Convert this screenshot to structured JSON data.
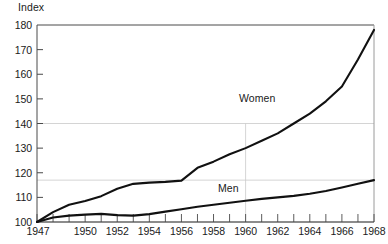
{
  "chart_data": {
    "type": "line",
    "title": "",
    "subtitle": "",
    "ylabel": "Index",
    "xlabel": "",
    "ylim": [
      100,
      180
    ],
    "xlim": [
      1947,
      1968
    ],
    "grid": "partial",
    "legend_position": "inline-annotation",
    "y_ticks": [
      100,
      110,
      120,
      130,
      140,
      150,
      160,
      170,
      180
    ],
    "x_ticks": [
      1947,
      1948,
      1949,
      1950,
      1951,
      1952,
      1953,
      1954,
      1955,
      1956,
      1957,
      1958,
      1959,
      1960,
      1961,
      1962,
      1963,
      1964,
      1965,
      1966,
      1967,
      1968
    ],
    "x_tick_labels": [
      "1947",
      "",
      "",
      "1950",
      "",
      "1952",
      "",
      "1954",
      "",
      "1956",
      "",
      "1958",
      "",
      "1960",
      "",
      "1962",
      "",
      "1964",
      "",
      "1966",
      "",
      "1968"
    ],
    "reference_lines": {
      "horizontal": [
        140,
        117
      ],
      "vertical": [
        1960
      ]
    },
    "x": [
      1947,
      1948,
      1949,
      1950,
      1951,
      1952,
      1953,
      1954,
      1955,
      1956,
      1957,
      1958,
      1959,
      1960,
      1961,
      1962,
      1963,
      1964,
      1965,
      1966,
      1967,
      1968
    ],
    "series": [
      {
        "name": "Women",
        "label": "Women",
        "color": "#111111",
        "values": [
          100.0,
          104.5,
          107.5,
          109.0,
          111.5,
          114.5,
          115.5,
          116.0,
          116.5,
          117.0,
          121.5,
          124.0,
          127.0,
          129.5,
          132.0,
          134.5,
          137.0,
          140.0,
          143.5,
          147.0,
          149.5,
          153.0
        ]
      },
      {
        "name": "Men",
        "label": "Men",
        "color": "#111111",
        "values": [
          100.0,
          101.5,
          102.5,
          103.0,
          103.2,
          102.8,
          102.5,
          103.0,
          104.0,
          105.0,
          106.0,
          107.0,
          108.0,
          109.0,
          110.0,
          110.8,
          111.3,
          112.0,
          113.0,
          114.2,
          115.5,
          117.0
        ]
      }
    ],
    "series_actual": {
      "women_points": [
        [
          1947,
          100.0
        ],
        [
          1948,
          104.0
        ],
        [
          1949,
          107.0
        ],
        [
          1950,
          108.5
        ],
        [
          1951,
          110.5
        ],
        [
          1952,
          113.5
        ],
        [
          1953,
          115.5
        ],
        [
          1954,
          116.0
        ],
        [
          1955,
          116.3
        ],
        [
          1956,
          116.8
        ],
        [
          1957,
          122.0
        ],
        [
          1958,
          124.5
        ],
        [
          1959,
          127.5
        ],
        [
          1960,
          130.0
        ],
        [
          1961,
          133.0
        ],
        [
          1962,
          136.0
        ],
        [
          1963,
          140.0
        ],
        [
          1964,
          144.0
        ],
        [
          1965,
          149.0
        ],
        [
          1966,
          155.0
        ],
        [
          1967,
          166.0
        ],
        [
          1968,
          178.0
        ]
      ],
      "men_points": [
        [
          1947,
          100.0
        ],
        [
          1948,
          101.8
        ],
        [
          1949,
          102.6
        ],
        [
          1950,
          103.0
        ],
        [
          1951,
          103.3
        ],
        [
          1952,
          102.8
        ],
        [
          1953,
          102.6
        ],
        [
          1954,
          103.2
        ],
        [
          1955,
          104.2
        ],
        [
          1956,
          105.2
        ],
        [
          1957,
          106.2
        ],
        [
          1958,
          107.0
        ],
        [
          1959,
          107.8
        ],
        [
          1960,
          108.6
        ],
        [
          1961,
          109.4
        ],
        [
          1962,
          110.0
        ],
        [
          1963,
          110.6
        ],
        [
          1964,
          111.5
        ],
        [
          1965,
          112.6
        ],
        [
          1966,
          114.0
        ],
        [
          1967,
          115.5
        ],
        [
          1968,
          117.0
        ]
      ]
    }
  },
  "annotations": {
    "women": "Women",
    "men": "Men"
  }
}
